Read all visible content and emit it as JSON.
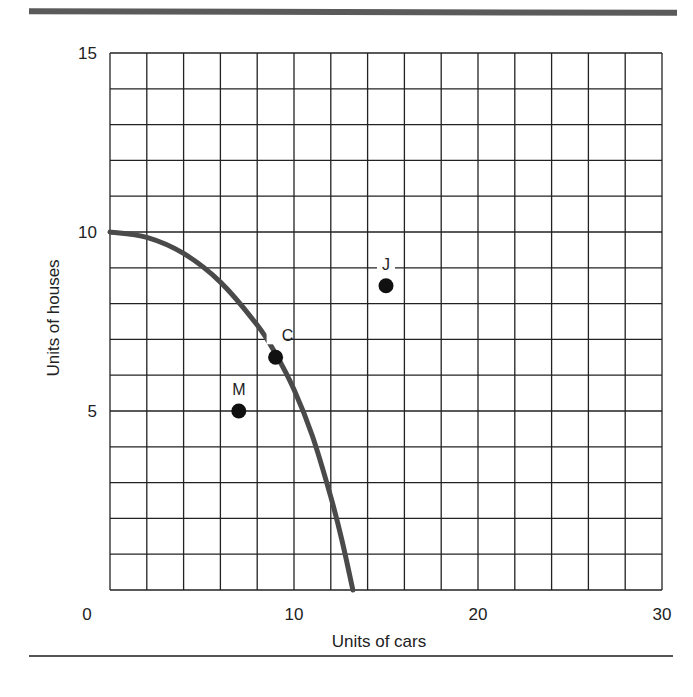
{
  "chart_data": {
    "type": "line",
    "title": "",
    "xlabel": "Units of cars",
    "ylabel": "Units of houses",
    "xlim": [
      0,
      30
    ],
    "ylim": [
      0,
      15
    ],
    "x_ticks": [
      "0",
      "10",
      "20",
      "30"
    ],
    "y_ticks": [
      "5",
      "10",
      "15"
    ],
    "grid": true,
    "grid_x_step": 2,
    "grid_y_step": 1,
    "series": [
      {
        "name": "Production possibilities frontier",
        "type": "curve",
        "color": "#4a4a4a",
        "points": [
          [
            0,
            10
          ],
          [
            2,
            9.85
          ],
          [
            4,
            9.4
          ],
          [
            6,
            8.6
          ],
          [
            8,
            7.4
          ],
          [
            9,
            6.6
          ],
          [
            10,
            5.6
          ],
          [
            11,
            4.3
          ],
          [
            12,
            2.6
          ],
          [
            12.6,
            1.4
          ],
          [
            13.2,
            0
          ]
        ]
      }
    ],
    "points": [
      {
        "label": "M",
        "x": 7,
        "y": 5
      },
      {
        "label": "C",
        "x": 9,
        "y": 6.5
      },
      {
        "label": "J",
        "x": 15,
        "y": 8.5
      }
    ]
  }
}
